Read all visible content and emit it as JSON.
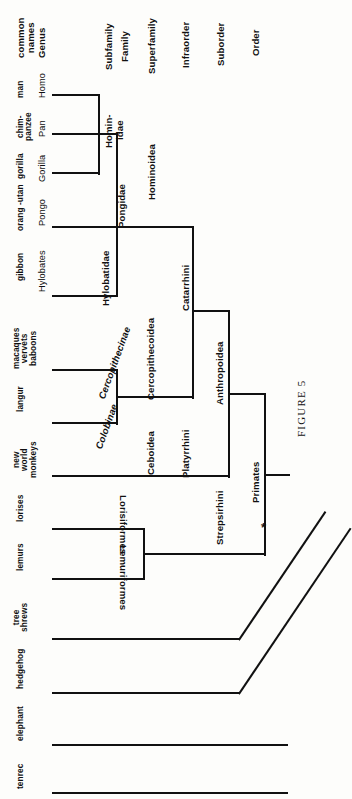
{
  "figure": {
    "caption": "FIGURE 5",
    "marker": "*",
    "orientation": "rotated-90",
    "line_color": "#111111",
    "background": "#fdfdfb"
  },
  "rank_headers": [
    {
      "id": "common-names",
      "lines": [
        "common",
        "names"
      ]
    },
    {
      "id": "genus",
      "lines": [
        "Genus"
      ]
    },
    {
      "id": "subfamily",
      "lines": [
        "Subfamily"
      ]
    },
    {
      "id": "family",
      "lines": [
        "Family"
      ]
    },
    {
      "id": "superfamily",
      "lines": [
        "Superfamily"
      ]
    },
    {
      "id": "infraorder",
      "lines": [
        "Infraorder"
      ]
    },
    {
      "id": "suborder",
      "lines": [
        "Suborder"
      ]
    },
    {
      "id": "order",
      "lines": [
        "Order"
      ]
    }
  ],
  "taxa": [
    {
      "id": "homo",
      "common": [
        "man"
      ],
      "genus": "Homo"
    },
    {
      "id": "pan",
      "common": [
        "chim-",
        "panzee"
      ],
      "genus": "Pan"
    },
    {
      "id": "gorilla",
      "common": [
        "gorilla"
      ],
      "genus": "Gorilla"
    },
    {
      "id": "pongo",
      "common": [
        "orang -utan"
      ],
      "genus": "Pongo"
    },
    {
      "id": "hylobates",
      "common": [
        "gibbon"
      ],
      "genus": "Hylobates"
    },
    {
      "id": "cercopith",
      "common": [
        "macaques",
        "vervets",
        "baboons"
      ],
      "genus": ""
    },
    {
      "id": "langur",
      "common": [
        "langur"
      ],
      "genus": ""
    },
    {
      "id": "nwm",
      "common": [
        "new",
        "world",
        "monkeys"
      ],
      "genus": ""
    },
    {
      "id": "lorises",
      "common": [
        "lorises"
      ],
      "genus": ""
    },
    {
      "id": "lemurs",
      "common": [
        "lemurs"
      ],
      "genus": ""
    },
    {
      "id": "treeshrews",
      "common": [
        "tree",
        "shrews"
      ],
      "genus": ""
    },
    {
      "id": "hedgehog",
      "common": [
        "hedgehog"
      ],
      "genus": ""
    },
    {
      "id": "elephant",
      "common": [
        "elephant"
      ],
      "genus": ""
    },
    {
      "id": "tenrec",
      "common": [
        "tenrec"
      ],
      "genus": ""
    }
  ],
  "clades": {
    "hominidae": "Homin-\nidae",
    "hominidae_l1": "Homin-",
    "hominidae_l2": "idae",
    "pongidae": "Pongidae",
    "hylobatidae": "Hylobatidae",
    "hominoidea": "Hominoidea",
    "cercopithecinae": "Cercopithecinae",
    "colobinae": "Colobinae",
    "cercopithecoidea": "Cercopithecoidea",
    "ceboidea": "Ceboidea",
    "catarrhini": "Catarrhini",
    "platyrrhini": "Platyrrhini",
    "anthropoidea": "Anthropoidea",
    "lorisiformes": "Lorisiformes",
    "lemuriformes": "Lemuriformes",
    "strepsirhini": "Strepsirhini",
    "primates": "Primates"
  }
}
